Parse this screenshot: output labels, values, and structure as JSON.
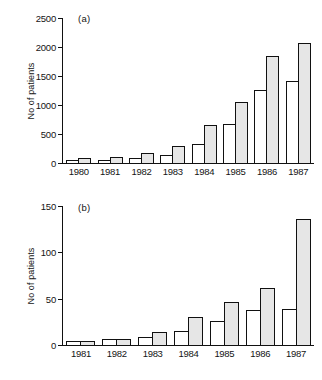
{
  "figure": {
    "width": 322,
    "height": 380,
    "background": "#ffffff",
    "bar_open_color": "#ffffff",
    "bar_filled_color": "#e6e6e6",
    "axis_color": "#111111"
  },
  "chart_data": [
    {
      "type": "bar",
      "panel_label": "(a)",
      "title": "",
      "xlabel": "",
      "ylabel": "No of patients",
      "categories": [
        "1980",
        "1981",
        "1982",
        "1983",
        "1984",
        "1985",
        "1986",
        "1987"
      ],
      "ylim": [
        0,
        2500
      ],
      "yticks": [
        0,
        500,
        1000,
        1500,
        2000,
        2500
      ],
      "grid": false,
      "legend": null,
      "series": [
        {
          "name": "open",
          "style": "unfilled",
          "values": [
            55,
            55,
            90,
            145,
            320,
            665,
            1260,
            1415
          ]
        },
        {
          "name": "shaded",
          "style": "filled",
          "values": [
            90,
            105,
            165,
            290,
            655,
            1060,
            1840,
            2075
          ]
        }
      ]
    },
    {
      "type": "bar",
      "panel_label": "(b)",
      "title": "",
      "xlabel": "",
      "ylabel": "No of patients",
      "categories": [
        "1981",
        "1982",
        "1983",
        "1984",
        "1985",
        "1986",
        "1987"
      ],
      "ylim": [
        0,
        150
      ],
      "yticks": [
        0,
        50,
        100,
        150
      ],
      "grid": false,
      "legend": null,
      "series": [
        {
          "name": "open",
          "style": "unfilled",
          "values": [
            4,
            6,
            9,
            15,
            26,
            38,
            39
          ]
        },
        {
          "name": "shaded",
          "style": "filled",
          "values": [
            4,
            6,
            14,
            30,
            46,
            61,
            136
          ]
        }
      ]
    }
  ]
}
